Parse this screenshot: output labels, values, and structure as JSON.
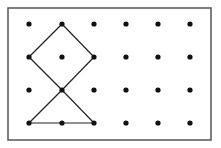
{
  "diagram": {
    "type": "dot-grid-geoboard",
    "background": "#ffffff",
    "border": {
      "x": 8,
      "y": 8,
      "width": 203,
      "height": 132,
      "color": "#555555",
      "stroke_width": 1.5
    },
    "grid": {
      "columns": 6,
      "rows": 4,
      "x_positions": [
        29,
        62,
        94,
        126,
        158,
        190
      ],
      "y_positions": [
        24,
        57,
        90,
        123
      ],
      "dot_radius": 2.6,
      "dot_color": "#111111"
    },
    "line_color": "#222222",
    "segments": [
      {
        "from": [
          1,
          0
        ],
        "to": [
          0,
          1
        ]
      },
      {
        "from": [
          0,
          1
        ],
        "to": [
          1,
          2
        ]
      },
      {
        "from": [
          1,
          2
        ],
        "to": [
          2,
          1
        ]
      },
      {
        "from": [
          2,
          1
        ],
        "to": [
          1,
          0
        ]
      },
      {
        "from": [
          1,
          2
        ],
        "to": [
          0,
          3
        ]
      },
      {
        "from": [
          1,
          2
        ],
        "to": [
          2,
          3
        ]
      },
      {
        "from": [
          0,
          3
        ],
        "to": [
          2,
          3
        ]
      }
    ],
    "shapes": [
      {
        "name": "square-diamond",
        "vertices": [
          [
            1,
            0
          ],
          [
            0,
            1
          ],
          [
            1,
            2
          ],
          [
            2,
            1
          ]
        ]
      },
      {
        "name": "triangle",
        "vertices": [
          [
            1,
            2
          ],
          [
            0,
            3
          ],
          [
            2,
            3
          ]
        ]
      }
    ]
  }
}
